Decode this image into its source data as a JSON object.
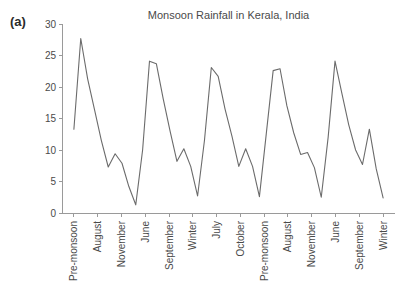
{
  "panel": {
    "label": "(a)"
  },
  "chart_data": {
    "type": "line",
    "title": "Monsoon Rainfall in Kerala, India",
    "xlabel": "",
    "ylabel": "",
    "ylim": [
      0,
      30
    ],
    "yticks": [
      0,
      5,
      10,
      15,
      20,
      25,
      30
    ],
    "grid": false,
    "legend": "none",
    "line_color": "#6b6b6b",
    "axis_color": "#9a9a9a",
    "categories": [
      "Pre-monsoon",
      "August",
      "November",
      "June",
      "September",
      "Winter",
      "July",
      "October",
      "Pre-monsoon",
      "August",
      "November",
      "June",
      "September",
      "Winter"
    ],
    "series": [
      {
        "name": "Rainfall",
        "x": [
          0.0,
          0.5,
          1.0,
          1.5,
          2.0,
          2.5,
          3.0,
          3.5,
          4.0,
          4.5,
          5.0,
          5.5,
          6.0,
          6.5,
          7.0,
          7.5,
          8.0,
          8.5,
          9.0,
          9.5,
          10.0,
          10.5,
          11.0,
          11.5,
          12.0,
          12.5,
          13.0,
          13.4
        ],
        "values": [
          13.3,
          27.7,
          21.3,
          16.4,
          11.5,
          7.3,
          9.4,
          7.9,
          4.2,
          1.3,
          10.0,
          24.1,
          23.7,
          18.1,
          13.0,
          8.2,
          10.2,
          7.4,
          2.7,
          11.5,
          23.1,
          21.7,
          16.5,
          12.2,
          7.4,
          10.2,
          7.4,
          2.6
        ]
      }
    ],
    "series_full": [
      13.3,
      27.7,
      21.3,
      16.4,
      11.5,
      7.3,
      9.4,
      7.9,
      4.2,
      1.3,
      10.0,
      24.1,
      23.7,
      18.1,
      13.0,
      8.2,
      10.2,
      7.4,
      2.7,
      11.5,
      23.1,
      21.7,
      16.5,
      12.2,
      7.4,
      10.2,
      7.4,
      2.6,
      12.6,
      22.6,
      22.9,
      17.0,
      12.7,
      9.3,
      9.6,
      7.2,
      2.5,
      12.0,
      24.1,
      19.0,
      14.0,
      10.0,
      7.7,
      13.3,
      7.0,
      2.4
    ]
  },
  "geometry": {
    "plot_left": 62,
    "plot_right": 395,
    "plot_top": 24,
    "plot_bottom": 213
  }
}
